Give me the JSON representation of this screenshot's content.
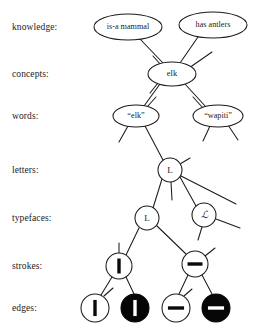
{
  "diagram": {
    "ink_color": "#1b1b1b",
    "fill_color": "#ffffff",
    "inverted_fill": "#060606",
    "rows": [
      {
        "id": "knowledge",
        "label": "knowledge:",
        "y": 27
      },
      {
        "id": "concepts",
        "label": "concepts:",
        "y": 74
      },
      {
        "id": "words",
        "label": "words:",
        "y": 116
      },
      {
        "id": "letters",
        "label": "letters:",
        "y": 170
      },
      {
        "id": "typefaces",
        "label": "typefaces:",
        "y": 218
      },
      {
        "id": "strokes",
        "label": "strokes:",
        "y": 266
      },
      {
        "id": "edges",
        "label": "edges:",
        "y": 308
      }
    ],
    "nodes": [
      {
        "id": "is-a-mammal",
        "row": "knowledge",
        "label": "is-a mammal",
        "shape": "ellipse",
        "cx": 128,
        "cy": 27,
        "rx": 34,
        "ry": 13,
        "text_class": "knowledge-text",
        "filled": false
      },
      {
        "id": "has-antlers",
        "row": "knowledge",
        "label": "has antlers",
        "shape": "ellipse",
        "cx": 213,
        "cy": 25,
        "rx": 34,
        "ry": 13,
        "text_class": "knowledge-text",
        "filled": false
      },
      {
        "id": "elk-concept",
        "row": "concepts",
        "label": "elk",
        "shape": "ellipse",
        "cx": 172,
        "cy": 74,
        "rx": 24,
        "ry": 12,
        "text_class": "concept-text",
        "filled": false
      },
      {
        "id": "elk-word",
        "row": "words",
        "label": "“elk”",
        "shape": "ellipse",
        "cx": 136,
        "cy": 116,
        "rx": 23,
        "ry": 11,
        "text_class": "word-text",
        "filled": false
      },
      {
        "id": "wapiti-word",
        "row": "words",
        "label": "“wapiti”",
        "shape": "ellipse",
        "cx": 218,
        "cy": 116,
        "rx": 25,
        "ry": 11,
        "text_class": "word-text",
        "filled": false
      },
      {
        "id": "letter-L",
        "row": "letters",
        "label": "L",
        "shape": "circle",
        "cx": 170,
        "cy": 170,
        "rx": 12,
        "ry": 12,
        "text_class": "letter-text",
        "filled": false
      },
      {
        "id": "typeface-L",
        "row": "typefaces",
        "label": "L",
        "shape": "circle",
        "cx": 147,
        "cy": 218,
        "rx": 12,
        "ry": 12,
        "text_class": "typeface-text",
        "filled": false
      },
      {
        "id": "typeface-script-L",
        "row": "typefaces",
        "label": "ℒ",
        "shape": "circle",
        "cx": 204,
        "cy": 215,
        "rx": 12,
        "ry": 12,
        "text_class": "typeface-script",
        "filled": false
      },
      {
        "id": "stroke-vertical",
        "row": "strokes",
        "label": "|",
        "shape": "circle",
        "cx": 119,
        "cy": 266,
        "rx": 13,
        "ry": 13,
        "text_class": "letter-text",
        "filled": false,
        "glyph": "vertical-bar"
      },
      {
        "id": "stroke-horizontal",
        "row": "strokes",
        "label": "−",
        "shape": "circle",
        "cx": 195,
        "cy": 264,
        "rx": 13,
        "ry": 13,
        "text_class": "letter-text",
        "filled": false,
        "glyph": "horizontal-bar"
      },
      {
        "id": "edge-vertical-light",
        "row": "edges",
        "label": "|",
        "shape": "circle",
        "cx": 95,
        "cy": 308,
        "rx": 14,
        "ry": 14,
        "filled": false,
        "glyph": "vertical-bar"
      },
      {
        "id": "edge-vertical-dark",
        "row": "edges",
        "label": "|",
        "shape": "circle",
        "cx": 135,
        "cy": 308,
        "rx": 14,
        "ry": 14,
        "filled": true,
        "glyph": "vertical-bar"
      },
      {
        "id": "edge-horizontal-light",
        "row": "edges",
        "label": "−",
        "shape": "circle",
        "cx": 176,
        "cy": 308,
        "rx": 14,
        "ry": 14,
        "filled": false,
        "glyph": "horizontal-bar"
      },
      {
        "id": "edge-horizontal-dark",
        "row": "edges",
        "label": "−",
        "shape": "circle",
        "cx": 216,
        "cy": 308,
        "rx": 14,
        "ry": 14,
        "filled": true,
        "glyph": "horizontal-bar"
      }
    ],
    "links": [
      {
        "id": "link-mammal-elk",
        "from": "is-a-mammal",
        "to": "elk-concept",
        "x1": 140,
        "y1": 39,
        "x2": 163,
        "y2": 63
      },
      {
        "id": "link-antlers-elk",
        "from": "has-antlers",
        "to": "elk-concept",
        "x1": 198,
        "y1": 37,
        "x2": 180,
        "y2": 63
      },
      {
        "id": "link-elk-elkword",
        "from": "elk-concept",
        "to": "elk-word",
        "x1": 160,
        "y1": 84,
        "x2": 144,
        "y2": 106
      },
      {
        "id": "link-elk-wapiti",
        "from": "elk-concept",
        "to": "wapiti-word",
        "x1": 185,
        "y1": 84,
        "x2": 206,
        "y2": 107
      },
      {
        "id": "link-elkword-letterL",
        "from": "elk-word",
        "to": "letter-L",
        "x1": 145,
        "y1": 126,
        "x2": 163,
        "y2": 160
      },
      {
        "id": "link-letterL-typeL",
        "from": "letter-L",
        "to": "typeface-L",
        "x1": 162,
        "y1": 179,
        "x2": 153,
        "y2": 208
      },
      {
        "id": "link-letterL-scriptL",
        "from": "letter-L",
        "to": "typeface-script-L",
        "x1": 180,
        "y1": 177,
        "x2": 196,
        "y2": 206
      },
      {
        "id": "link-typeL-strokeV",
        "from": "typeface-L",
        "to": "stroke-vertical",
        "x1": 139,
        "y1": 228,
        "x2": 126,
        "y2": 255
      },
      {
        "id": "link-typeL-strokeH",
        "from": "typeface-L",
        "to": "stroke-horizontal",
        "x1": 157,
        "y1": 226,
        "x2": 186,
        "y2": 254
      },
      {
        "id": "link-strokeV-edge1",
        "from": "stroke-vertical",
        "to": "edge-vertical-light",
        "x1": 112,
        "y1": 277,
        "x2": 101,
        "y2": 295
      },
      {
        "id": "link-strokeV-edge2",
        "from": "stroke-vertical",
        "to": "edge-vertical-dark",
        "x1": 126,
        "y1": 277,
        "x2": 134,
        "y2": 294
      },
      {
        "id": "link-strokeH-edge3",
        "from": "stroke-horizontal",
        "to": "edge-horizontal-light",
        "x1": 188,
        "y1": 275,
        "x2": 179,
        "y2": 294
      },
      {
        "id": "link-strokeH-edge4",
        "from": "stroke-horizontal",
        "to": "edge-horizontal-dark",
        "x1": 202,
        "y1": 275,
        "x2": 212,
        "y2": 294
      }
    ],
    "stubs": [
      {
        "id": "stub-elk-upright",
        "owner": "elk-concept",
        "x1": 189,
        "y1": 68,
        "x2": 212,
        "y2": 52
      },
      {
        "id": "stub-elk-upleft",
        "owner": "elk-concept",
        "x1": 161,
        "y1": 65,
        "x2": 153,
        "y2": 56
      },
      {
        "id": "stub-elk-downleft",
        "owner": "elk-concept",
        "x1": 158,
        "y1": 83,
        "x2": 150,
        "y2": 93
      },
      {
        "id": "stub-elkword-upright",
        "owner": "elk-word",
        "x1": 147,
        "y1": 107,
        "x2": 156,
        "y2": 97
      },
      {
        "id": "stub-elkword-downleft",
        "owner": "elk-word",
        "x1": 128,
        "y1": 126,
        "x2": 119,
        "y2": 142
      },
      {
        "id": "stub-wapiti-upleft",
        "owner": "wapiti-word",
        "x1": 203,
        "y1": 108,
        "x2": 193,
        "y2": 97
      },
      {
        "id": "stub-wapiti-downleft",
        "owner": "wapiti-word",
        "x1": 210,
        "y1": 126,
        "x2": 203,
        "y2": 141
      },
      {
        "id": "stub-wapiti-downright",
        "owner": "wapiti-word",
        "x1": 228,
        "y1": 125,
        "x2": 238,
        "y2": 140
      },
      {
        "id": "stub-letterL-upright",
        "owner": "letter-L",
        "x1": 180,
        "y1": 164,
        "x2": 190,
        "y2": 158
      },
      {
        "id": "stub-letterL-down",
        "owner": "letter-L",
        "x1": 171,
        "y1": 182,
        "x2": 172,
        "y2": 200
      },
      {
        "id": "stub-letterL-right",
        "owner": "letter-L",
        "x1": 181,
        "y1": 176,
        "x2": 236,
        "y2": 204
      },
      {
        "id": "stub-scriptL-downleft",
        "owner": "typeface-script-L",
        "x1": 202,
        "y1": 227,
        "x2": 198,
        "y2": 240
      },
      {
        "id": "stub-scriptL-right",
        "owner": "typeface-script-L",
        "x1": 216,
        "y1": 219,
        "x2": 240,
        "y2": 228
      },
      {
        "id": "stub-strokeV-up",
        "owner": "stroke-vertical",
        "x1": 119,
        "y1": 253,
        "x2": 119,
        "y2": 243
      },
      {
        "id": "stub-strokeH-upright",
        "owner": "stroke-horizontal",
        "x1": 205,
        "y1": 256,
        "x2": 215,
        "y2": 248
      },
      {
        "id": "stub-edge1-up",
        "owner": "edge-vertical-light",
        "x1": 104,
        "y1": 296,
        "x2": 113,
        "y2": 288
      },
      {
        "id": "stub-edge3-up",
        "owner": "edge-horizontal-light",
        "x1": 184,
        "y1": 296,
        "x2": 192,
        "y2": 289
      }
    ]
  }
}
